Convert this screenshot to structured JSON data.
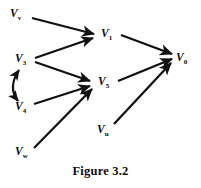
{
  "figure": {
    "caption": "Figure 3.2",
    "ink_color": "#111111",
    "background_color": "#ffffff",
    "width": 201,
    "height": 188
  },
  "nodes": [
    {
      "id": "v_v",
      "base": "V",
      "subscript": "v",
      "x": 10,
      "y": 8,
      "name": "node-v-v"
    },
    {
      "id": "v_1",
      "base": "V",
      "subscript": "1",
      "x": 101,
      "y": 28,
      "name": "node-v-1"
    },
    {
      "id": "v_3",
      "base": "V",
      "subscript": "3",
      "x": 15,
      "y": 53,
      "name": "node-v-3"
    },
    {
      "id": "v_0",
      "base": "V",
      "subscript": "0",
      "x": 176,
      "y": 52,
      "name": "node-v-0"
    },
    {
      "id": "v_5",
      "base": "V",
      "subscript": "5",
      "x": 98,
      "y": 76,
      "name": "node-v-5"
    },
    {
      "id": "v_4",
      "base": "V",
      "subscript": "4",
      "x": 15,
      "y": 101,
      "name": "node-v-4"
    },
    {
      "id": "v_u",
      "base": "V",
      "subscript": "u",
      "x": 97,
      "y": 124,
      "name": "node-v-u"
    },
    {
      "id": "v_w",
      "base": "V",
      "subscript": "w",
      "x": 15,
      "y": 146,
      "name": "node-v-w"
    }
  ],
  "edges": [
    {
      "from": "v_v",
      "to": "v_1",
      "type": "arrow",
      "label": "V_v to V_1"
    },
    {
      "from": "v_3",
      "to": "v_1",
      "type": "arrow",
      "label": "V_3 to V_1"
    },
    {
      "from": "v_3",
      "to": "v_5",
      "type": "arrow",
      "label": "V_3 to V_5"
    },
    {
      "from": "v_4",
      "to": "v_5",
      "type": "arrow",
      "label": "V_4 to V_5"
    },
    {
      "from": "v_w",
      "to": "v_5",
      "type": "arrow",
      "label": "V_w to V_5"
    },
    {
      "from": "v_1",
      "to": "v_0",
      "type": "arrow",
      "label": "V_1 to V_0"
    },
    {
      "from": "v_5",
      "to": "v_0",
      "type": "arrow",
      "label": "V_5 to V_0"
    },
    {
      "from": "v_u",
      "to": "v_0",
      "type": "arrow",
      "label": "V_u to V_0"
    },
    {
      "from": "v_3",
      "to": "v_4",
      "type": "double-arrow-curved",
      "label": "V_3 and V_4 bidirectional"
    }
  ]
}
